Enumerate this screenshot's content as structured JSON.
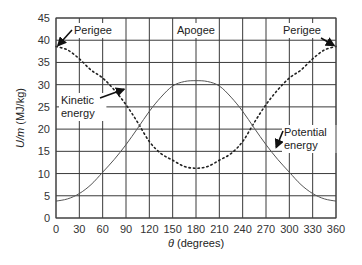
{
  "chart_data": {
    "type": "line",
    "title": "",
    "xlabel": "θ (degrees)",
    "xlabel_symbol": "θ",
    "xlabel_unit": " (degrees)",
    "ylabel": "U/m (MJ/kg)",
    "ylabel_symbol": "U/m",
    "ylabel_unit": " (MJ/kg)",
    "xlim": [
      0,
      360
    ],
    "ylim": [
      0,
      45
    ],
    "xticks": [
      0,
      30,
      60,
      90,
      120,
      150,
      180,
      210,
      240,
      270,
      300,
      330,
      360
    ],
    "yticks": [
      0,
      5,
      10,
      15,
      20,
      25,
      30,
      35,
      40,
      45
    ],
    "grid": true,
    "x": [
      0,
      15,
      30,
      45,
      60,
      75,
      90,
      105,
      120,
      135,
      150,
      165,
      180,
      195,
      210,
      225,
      240,
      255,
      270,
      285,
      300,
      315,
      330,
      345,
      360
    ],
    "series": [
      {
        "name": "Kinetic energy",
        "style": "dotted",
        "values": [
          38.6,
          37.8,
          35.8,
          33.3,
          31.5,
          28.8,
          25.5,
          21.5,
          17.2,
          14.5,
          13.0,
          11.6,
          11.2,
          11.6,
          13.0,
          14.5,
          17.2,
          21.5,
          25.5,
          28.8,
          31.5,
          33.3,
          35.8,
          37.8,
          38.6
        ]
      },
      {
        "name": "Potential energy",
        "style": "solid",
        "values": [
          3.8,
          4.3,
          5.5,
          7.5,
          10.3,
          13.2,
          16.5,
          20.2,
          24.0,
          27.2,
          29.7,
          30.7,
          30.9,
          30.7,
          29.7,
          27.2,
          24.0,
          20.2,
          16.5,
          13.2,
          10.3,
          7.5,
          5.5,
          4.3,
          3.8
        ]
      }
    ],
    "annotations": [
      {
        "text": "Perigee",
        "points_to": {
          "x": 0,
          "y": 38.6
        }
      },
      {
        "text": "Apogee",
        "at_x": 180
      },
      {
        "text": "Perigee",
        "points_to": {
          "x": 360,
          "y": 38.6
        }
      },
      {
        "text": "Kinetic",
        "text2": "energy",
        "points_to": {
          "x": 72,
          "y": 29.2
        }
      },
      {
        "text": "Potential",
        "text2": "energy",
        "points_to": {
          "x": 278,
          "y": 15.0
        }
      }
    ]
  }
}
